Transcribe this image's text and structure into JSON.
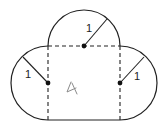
{
  "diagram": {
    "shapes": {
      "square": {
        "side_note": "dashed internal edges (top, left, right), solid bottom edge"
      },
      "semicircles": [
        {
          "position": "top",
          "radius_label": "1"
        },
        {
          "position": "left",
          "radius_label": "1"
        },
        {
          "position": "right",
          "radius_label": "1"
        }
      ]
    },
    "labels": {
      "top_radius": "1",
      "left_radius": "1",
      "right_radius": "1"
    },
    "handwritten_mark": "4",
    "colors": {
      "stroke": "#222222",
      "handwriting": "#8a8a8a",
      "background": "#ffffff"
    }
  }
}
